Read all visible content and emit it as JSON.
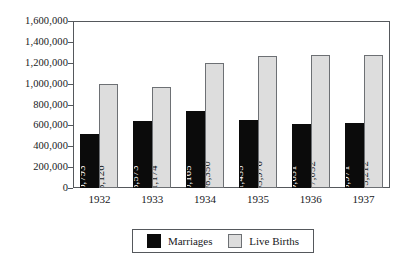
{
  "chart_data": {
    "type": "bar",
    "title": "",
    "subtitle": "",
    "xlabel": "",
    "ylabel": "",
    "categories": [
      "1932",
      "1933",
      "1934",
      "1935",
      "1936",
      "1937"
    ],
    "series": [
      {
        "name": "Marriages",
        "color": "#0b0b0b",
        "values": [
          516793,
          638573,
          740165,
          651435,
          609631,
          618971
        ],
        "labels": [
          "516,793",
          "638,573",
          "740,165",
          "651,435",
          "609,631",
          "618,971"
        ]
      },
      {
        "name": "Live Births",
        "color": "#dddddd",
        "values": [
          993126,
          971174,
          1198350,
          1263976,
          1277052,
          1275212
        ],
        "labels": [
          "993,126",
          "971,174",
          "1,198,350",
          "1,263,976",
          "1,277,052",
          "1,275,212"
        ]
      }
    ],
    "ylim": [
      0,
      1600000
    ],
    "ytick_step": 200000,
    "ytick_labels": [
      "0",
      "200,000",
      "400,000",
      "600,000",
      "800,000",
      "1,000,000",
      "1,200,000",
      "1,400,000",
      "1,600,000"
    ],
    "ytick_values": [
      0,
      200000,
      400000,
      600000,
      800000,
      1000000,
      1200000,
      1400000,
      1600000
    ],
    "grid": false,
    "legend_position": "bottom",
    "legend": [
      {
        "label": "Marriages",
        "swatch": "marriages"
      },
      {
        "label": "Live Births",
        "swatch": "births"
      }
    ]
  }
}
